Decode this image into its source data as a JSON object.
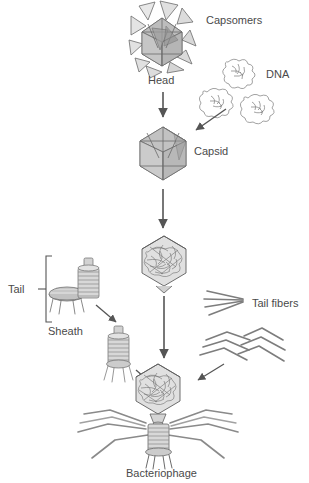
{
  "figure": {
    "background_color": "#ffffff",
    "line_color": "#6b6b6b",
    "fill_light": "#e2e2e2",
    "fill_mid": "#c9c9c9",
    "fill_dark": "#a8a8a8",
    "text_color": "#4a4a4a"
  },
  "labels": {
    "capsomers": "Capsomers",
    "head": "Head",
    "dna": "DNA",
    "capsid": "Capsid",
    "tail": "Tail",
    "sheath": "Sheath",
    "tail_fibers": "Tail fibers",
    "bacteriophage": "Bacteriophage",
    "plus": "+"
  },
  "components": [
    {
      "name": "head",
      "label": "Head",
      "description": "exploded icosahedral head of triangular capsomers"
    },
    {
      "name": "dna",
      "label": "DNA",
      "description": "three tangled DNA coils"
    },
    {
      "name": "capsid",
      "label": "Capsid",
      "description": "assembled empty icosahedral capsid"
    },
    {
      "name": "filled-capsid",
      "label": "",
      "description": "capsid filled with DNA"
    },
    {
      "name": "base-plate",
      "label": "Tail",
      "description": "tail base plate with spikes"
    },
    {
      "name": "sheath",
      "label": "Sheath",
      "description": "ribbed contractile sheath cylinder"
    },
    {
      "name": "tail-assembly",
      "label": "",
      "description": "sheath joined to base plate"
    },
    {
      "name": "tail-fibers",
      "label": "Tail fibers",
      "description": "straight and bent tail fibers"
    },
    {
      "name": "bacteriophage",
      "label": "Bacteriophage",
      "description": "complete assembled virion"
    }
  ],
  "arrows": [
    {
      "name": "head-to-capsid",
      "type": "vertical"
    },
    {
      "name": "dna-to-capsid",
      "type": "diagonal"
    },
    {
      "name": "capsid-to-filled",
      "type": "vertical"
    },
    {
      "name": "filled-to-phage",
      "type": "vertical"
    },
    {
      "name": "sheath-to-tail-assembly",
      "type": "diagonal"
    },
    {
      "name": "tail-assembly-to-phage",
      "type": "diagonal"
    },
    {
      "name": "fibers-to-phage",
      "type": "diagonal"
    }
  ]
}
